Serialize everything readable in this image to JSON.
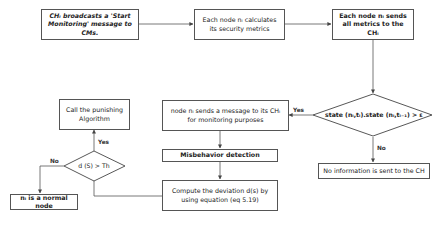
{
  "nodes": {
    "broadcast": "CHᵢ broadcasts a 'Start Monitoring' message to CMs.",
    "calculate": "Each node nᵢ calculates its security metrics",
    "send_all": "Each node nᵢ sends all metrics to the CHᵢ",
    "decision_state": "state (nᵢ,tᵢ).state (nᵢ,tᵢ₋₁) > ε",
    "send_message": "node nᵢ sends a message to its CHᵢ for monitoring purposes",
    "misbehavior": "Misbehavior detection",
    "compute": "Compute the deviation d(s) by using equation (eq 5.19)",
    "no_info": "No information is sent to the CH",
    "punish": "Call the punishing Algorithm",
    "decision_threshold": "d (S) > Th",
    "normal": "nᵢ is a normal node"
  },
  "edge_labels": {
    "state_yes": "Yes",
    "state_no": "No",
    "threshold_yes": "Yes",
    "threshold_no": "No"
  }
}
